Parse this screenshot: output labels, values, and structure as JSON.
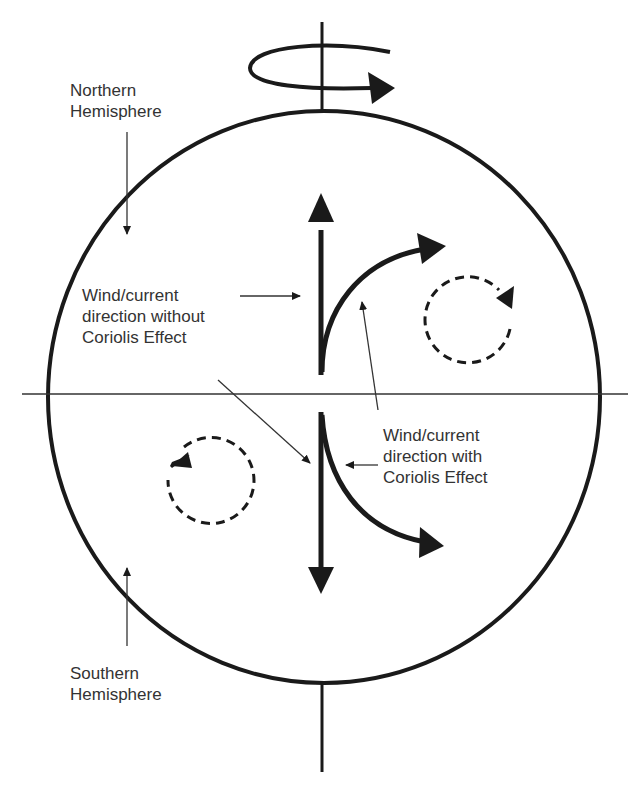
{
  "diagram": {
    "labels": {
      "northern": "Northern\nHemisphere",
      "southern": "Southern\nHemisphere",
      "without": "Wind/current\ndirection without\nCoriolis Effect",
      "with": "Wind/current\ndirection with\nCoriolis Effect"
    },
    "colors": {
      "stroke": "#1a1a1a",
      "text": "#333333",
      "background": "#ffffff"
    },
    "icons": [
      "rotation-arrow-icon",
      "clockwise-dashed-circle-icon",
      "counterclockwise-dashed-circle-icon"
    ]
  }
}
